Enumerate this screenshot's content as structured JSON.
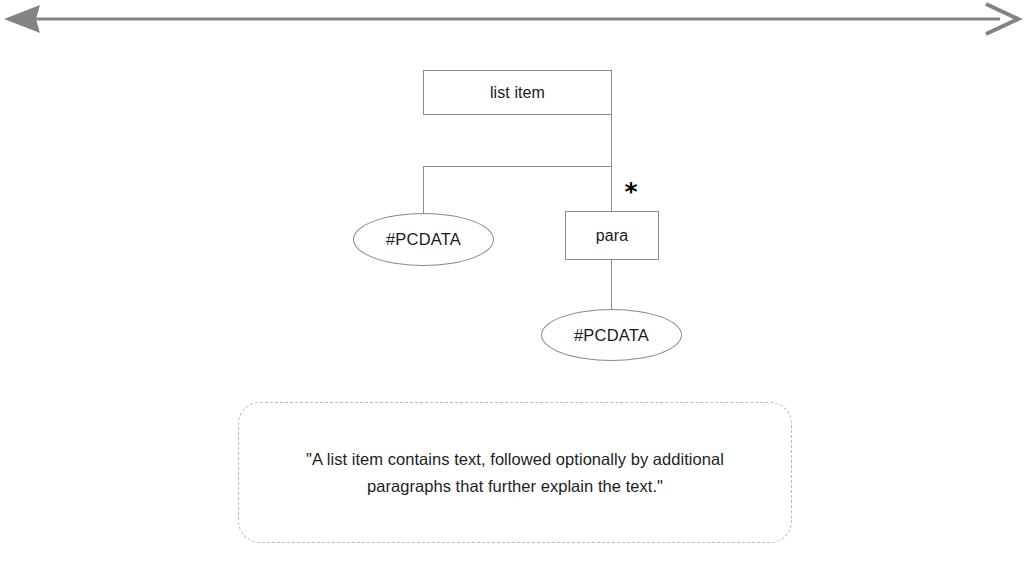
{
  "diagram": {
    "scale_arrow": {
      "name": "horizontal-double-arrow",
      "color": "#808080",
      "left_head": "filled-arrowhead",
      "right_head": "open-chevron-arrowhead"
    },
    "nodes": [
      {
        "id": "list-item",
        "label": "list item",
        "shape": "rectangle",
        "role": "root-element"
      },
      {
        "id": "pcdata-1",
        "label": "#PCDATA",
        "shape": "ellipse",
        "role": "text-content"
      },
      {
        "id": "para",
        "label": "para",
        "shape": "rectangle",
        "role": "child-element"
      },
      {
        "id": "pcdata-2",
        "label": "#PCDATA",
        "shape": "ellipse",
        "role": "text-content"
      }
    ],
    "occurrence_indicator": {
      "symbol": "*",
      "applies_to": "para",
      "meaning": "zero or more"
    },
    "line_color": "#8e8e8e"
  },
  "callout": {
    "text": "\"A list item contains text, followed optionally by additional paragraphs that further explain the text.\"",
    "border_style": "dashed",
    "border_color": "#b9b9b9"
  }
}
